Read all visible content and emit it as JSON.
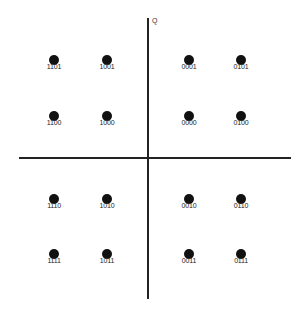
{
  "chart_data": {
    "type": "scatter",
    "title": "",
    "axes": {
      "vertical_label": "Q",
      "horizontal_label": ""
    },
    "grid": false,
    "points": [
      {
        "label": "1101",
        "i": -3,
        "q": 3,
        "x": 54,
        "y": 60
      },
      {
        "label": "1001",
        "i": -1,
        "q": 3,
        "x": 107,
        "y": 60
      },
      {
        "label": "0001",
        "i": 1,
        "q": 3,
        "x": 189,
        "y": 60
      },
      {
        "label": "0101",
        "i": 3,
        "q": 3,
        "x": 241,
        "y": 60
      },
      {
        "label": "1100",
        "i": -3,
        "q": 1,
        "x": 54,
        "y": 116
      },
      {
        "label": "1000",
        "i": -1,
        "q": 1,
        "x": 107,
        "y": 116
      },
      {
        "label": "0000",
        "i": 1,
        "q": 1,
        "x": 189,
        "y": 116
      },
      {
        "label": "0100",
        "i": 3,
        "q": 1,
        "x": 241,
        "y": 116
      },
      {
        "label": "1110",
        "i": -3,
        "q": -1,
        "x": 54,
        "y": 199
      },
      {
        "label": "1010",
        "i": -1,
        "q": -1,
        "x": 107,
        "y": 199
      },
      {
        "label": "0010",
        "i": 1,
        "q": -1,
        "x": 189,
        "y": 199
      },
      {
        "label": "0110",
        "i": 3,
        "q": -1,
        "x": 241,
        "y": 199
      },
      {
        "label": "1111",
        "i": -3,
        "q": -3,
        "x": 54,
        "y": 254
      },
      {
        "label": "1011",
        "i": -1,
        "q": -3,
        "x": 107,
        "y": 254
      },
      {
        "label": "0011",
        "i": 1,
        "q": -3,
        "x": 189,
        "y": 254
      },
      {
        "label": "0111",
        "i": 3,
        "q": -3,
        "x": 241,
        "y": 254
      }
    ]
  },
  "colors": {
    "dot": "#111111",
    "axis": "#222222",
    "background": "#ffffff"
  }
}
